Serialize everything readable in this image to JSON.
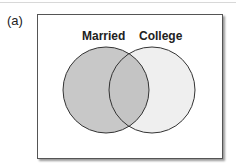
{
  "panel_label": "(a)",
  "diagram": {
    "type": "venn",
    "sets": [
      {
        "name": "Married",
        "shaded": true,
        "fill": "#c8c8c8"
      },
      {
        "name": "College",
        "shaded": false,
        "fill": "#efefef"
      }
    ],
    "intersection_fill": "#c4c4c4"
  }
}
